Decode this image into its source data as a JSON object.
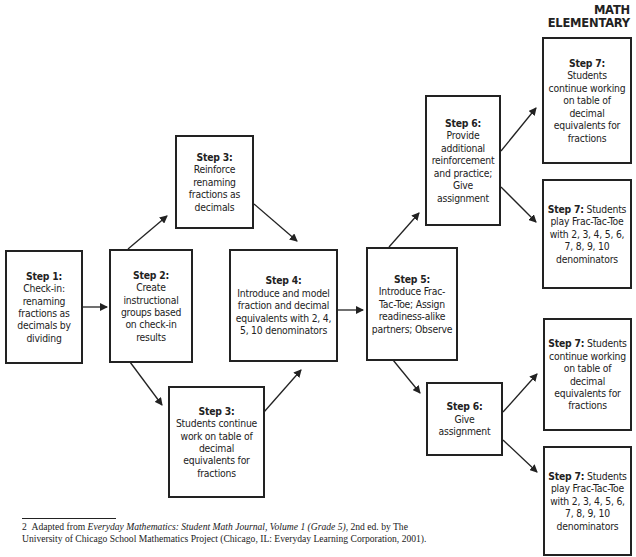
{
  "header": {
    "line1": "MATH",
    "line2": "ELEMENTARY"
  },
  "steps": {
    "step1": {
      "label": "Step 1:",
      "text": "Check-in: renaming fractions as decimals by dividing"
    },
    "step2": {
      "label": "Step 2:",
      "text": "Create instructional groups based on check-in results"
    },
    "step3a": {
      "label": "Step 3:",
      "text": "Reinforce renaming fractions as decimals"
    },
    "step3b": {
      "label": "Step 3:",
      "text": "Students continue work on table of decimal equivalents for fractions"
    },
    "step4": {
      "label": "Step 4:",
      "text": "Introduce and model fraction and decimal equivalents with 2, 4, 5, 10 denominators"
    },
    "step5": {
      "label": "Step 5:",
      "text": "Introduce Frac-Tac-Toe; Assign readiness-alike partners; Observe"
    },
    "step6a": {
      "label": "Step 6:",
      "text": "Provide additional reinforcement and practice; Give assignment"
    },
    "step6b": {
      "label": "Step 6:",
      "text": "Give assignment"
    },
    "step7a": {
      "label": "Step 7:",
      "text": "Students continue working on table of decimal equivalents for fractions"
    },
    "step7b": {
      "label": "Step 7:",
      "text": " Students play Frac-Tac-Toe with 2, 3, 4, 5, 6, 7, 8, 9, 10 denominators"
    },
    "step7c": {
      "label": "Step 7:",
      "text": " Students continue working on table of decimal equivalents for fractions"
    },
    "step7d": {
      "label": "Step 7:",
      "text": " Students play Frac-Tac-Toe with 2, 3, 4, 5, 6, 7, 8, 9, 10 denominators"
    }
  },
  "footnote": {
    "number": "2",
    "prefix": "Adapted from ",
    "title": "Everyday Mathematics: Student Math Journal, Volume 1 (Grade 5)",
    "suffix": ", 2nd ed. by The University of Chicago School Mathematics Project (Chicago, IL: Everyday Learning Corporation, 2001)."
  },
  "colors": {
    "ink": "#222222",
    "background": "#ffffff"
  }
}
